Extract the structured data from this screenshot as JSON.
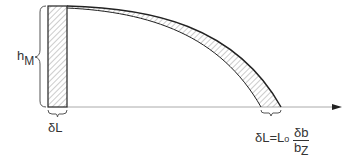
{
  "diagram": {
    "labels": {
      "height": {
        "main": "h",
        "sub": "M"
      },
      "width_left": "δL",
      "formula": {
        "lhs": "δL=L",
        "lhs_sub": "o",
        "num": "δb",
        "den_main": "b",
        "den_sub": "Z"
      }
    },
    "colors": {
      "line": "#222222",
      "hatch": "#888888",
      "axis": "#999999"
    }
  }
}
